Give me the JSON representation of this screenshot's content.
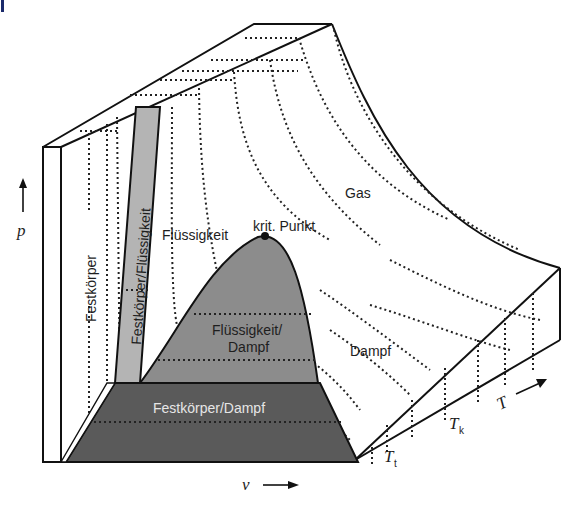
{
  "diagram": {
    "type": "p-v-T surface of a pure substance",
    "axes": {
      "pressure": "p",
      "volume": "v",
      "temperature": "T"
    },
    "regions": {
      "solid": "Festkörper",
      "solid_liquid": "Festkörper/Flüssigkeit",
      "liquid": "Flüssigkeit",
      "liquid_vapor_line1": "Flüssigkeit/",
      "liquid_vapor_line2": "Dampf",
      "solid_vapor": "Festkörper/Dampf",
      "vapor": "Dampf",
      "gas": "Gas"
    },
    "points": {
      "critical_point": "krit. Punkt"
    },
    "temperatures": {
      "triple": {
        "symbol": "T",
        "subscript": "t"
      },
      "critical": {
        "symbol": "T",
        "subscript": "k"
      }
    },
    "colors": {
      "solid_liquid_fill": "#b4b4b4",
      "liquid_vapor_fill": "#8c8c8c",
      "solid_vapor_fill": "#5a5a5a",
      "line": "#111111",
      "corner_mark": "#1b2a6b"
    }
  }
}
